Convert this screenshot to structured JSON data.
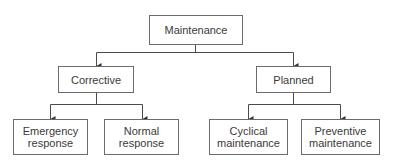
{
  "diagram": {
    "type": "tree",
    "root": {
      "label": "Maintenance"
    },
    "level1": [
      {
        "label": "Corrective"
      },
      {
        "label": "Planned"
      }
    ],
    "level2": [
      {
        "parent": "Corrective",
        "line1": "Emergency",
        "line2": "response"
      },
      {
        "parent": "Corrective",
        "line1": "Normal",
        "line2": "response"
      },
      {
        "parent": "Planned",
        "line1": "Cyclical",
        "line2": "maintenance"
      },
      {
        "parent": "Planned",
        "line1": "Preventive",
        "line2": "maintenance"
      }
    ],
    "colors": {
      "line": "#4a4a4a",
      "border": "#6b6b6b",
      "text": "#3a3a3a"
    }
  }
}
